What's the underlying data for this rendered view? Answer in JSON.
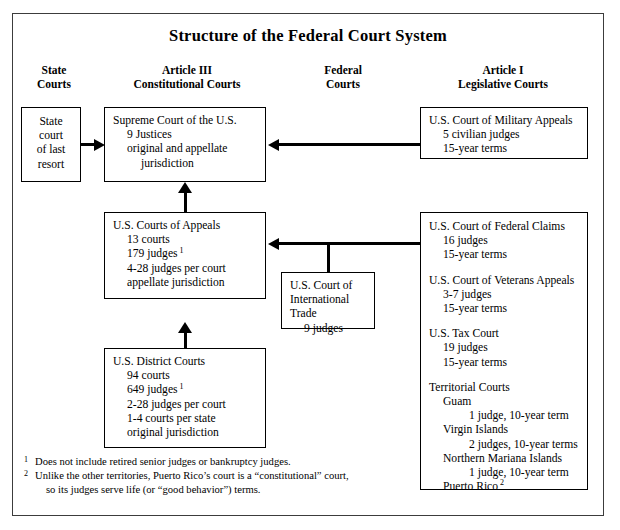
{
  "title": "Structure of the Federal Court System",
  "column_headers": [
    {
      "name": "state-courts",
      "lines": [
        "State",
        "Courts"
      ]
    },
    {
      "name": "article-iii-constitutional-courts",
      "lines": [
        "Article III",
        "Constitutional Courts"
      ]
    },
    {
      "name": "federal-courts",
      "lines": [
        "Federal",
        "Courts"
      ]
    },
    {
      "name": "article-i-legislative-courts",
      "lines": [
        "Article I",
        "Legislative Courts"
      ]
    }
  ],
  "boxes": {
    "state_court": {
      "title": "State court of last resort",
      "lines": [
        "State",
        "court",
        "of last",
        "resort"
      ]
    },
    "supreme_court": {
      "heading": "Supreme Court of the U.S.",
      "details": [
        "9 Justices",
        "original and appellate",
        "jurisdiction"
      ]
    },
    "courts_of_appeals": {
      "heading": "U.S. Courts of Appeals",
      "details": [
        "13 courts",
        "179 judges",
        "4-28 judges per court",
        "appellate jurisdiction"
      ],
      "judges_footnote": "1"
    },
    "district_courts": {
      "heading": "U.S. District Courts",
      "details": [
        "94 courts",
        "649 judges",
        "2-28 judges per court",
        "1-4 courts per state",
        "original jurisdiction"
      ],
      "judges_footnote": "1"
    },
    "international_trade": {
      "heading_line1": "U.S. Court of",
      "heading_line2": "International Trade",
      "detail": "9 judges"
    },
    "military_appeals": {
      "heading": "U.S. Court of Military Appeals",
      "details": [
        "5 civilian judges",
        "15-year terms"
      ]
    },
    "article_i_courts": {
      "federal_claims": {
        "heading": "U.S. Court of Federal Claims",
        "details": [
          "16 judges",
          "15-year terms"
        ]
      },
      "veterans_appeals": {
        "heading": "U.S. Court of Veterans Appeals",
        "details": [
          "3-7 judges",
          "15-year terms"
        ]
      },
      "tax_court": {
        "heading": "U.S. Tax Court",
        "details": [
          "19 judges",
          "15-year terms"
        ]
      },
      "territorial_courts": {
        "heading": "Territorial Courts",
        "entries": [
          {
            "name": "Guam",
            "detail": "1 judge, 10-year term"
          },
          {
            "name": "Virgin Islands",
            "detail": "2 judges, 10-year terms"
          },
          {
            "name": "Northern Mariana Islands",
            "detail": "1 judge, 10-year term"
          },
          {
            "name": "Puerto Rico",
            "detail": "",
            "footnote": "2"
          }
        ]
      }
    }
  },
  "footnotes": [
    {
      "mark": "1",
      "lines": [
        "Does not include retired senior judges or bankruptcy judges."
      ]
    },
    {
      "mark": "2",
      "lines": [
        "Unlike the other territories, Puerto Rico’s court is a “constitutional” court,",
        "so its judges serve life (or “good behavior”) terms."
      ]
    }
  ],
  "colors": {
    "ink": "#000000",
    "frame": "#3c3c3c",
    "background": "#ffffff"
  }
}
